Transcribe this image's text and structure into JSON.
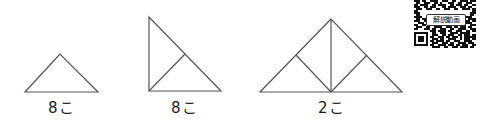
{
  "figures": [
    {
      "id": "single-triangle",
      "description": "small right isosceles triangle (hypotenuse as base)",
      "label": "8こ",
      "count": 8
    },
    {
      "id": "split-right-triangle",
      "description": "right isosceles triangle split into two small triangles",
      "label": "8こ",
      "count": 8
    },
    {
      "id": "large-triangle",
      "description": "large right isosceles triangle split into four small triangles",
      "label": "2こ",
      "count": 2
    }
  ],
  "qr": {
    "badge_label": "解説動画",
    "icon": "qr-code-icon"
  },
  "colors": {
    "stroke": "#555555",
    "text": "#222222",
    "background": "#ffffff"
  }
}
